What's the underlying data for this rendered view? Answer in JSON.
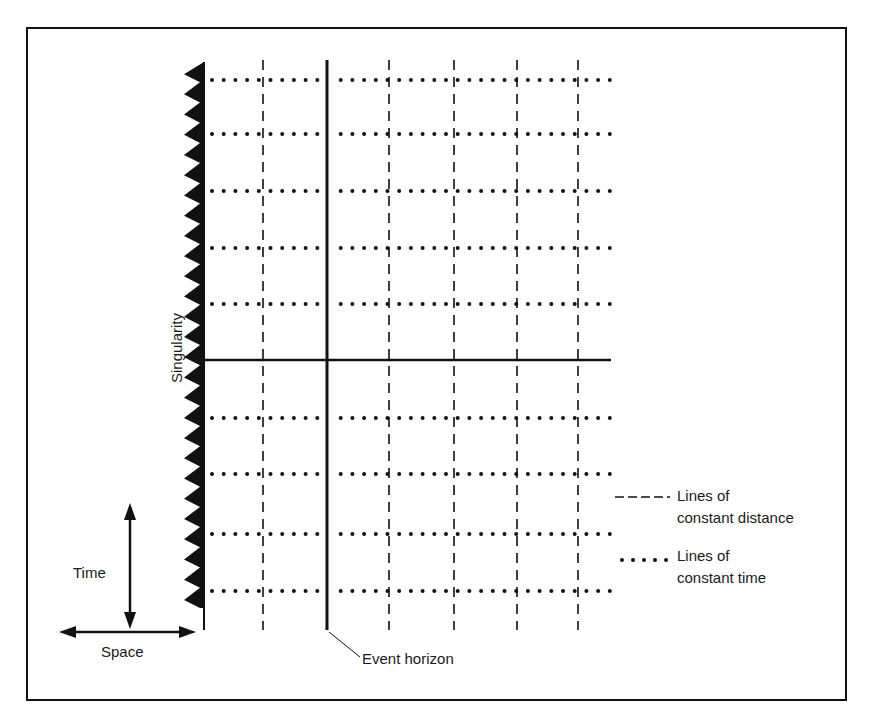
{
  "figure": {
    "border": {
      "x": 27,
      "y": 28,
      "w": 819,
      "h": 672
    },
    "ink_color": "#111111",
    "background": "#ffffff"
  },
  "singularity": {
    "label": "Singularity",
    "line_x": 204,
    "y_top": 62,
    "y_bottom": 630,
    "teeth_y_start": 62,
    "teeth_y_end": 608,
    "teeth_count": 27,
    "teeth_depth": 20
  },
  "event_horizon": {
    "label": "Event horizon",
    "x": 327,
    "y_top": 60,
    "y_bottom": 630
  },
  "horizontal_axis": {
    "y": 360,
    "x_start": 204,
    "x_end": 611
  },
  "distance_lines_x": [
    263,
    389,
    454,
    517,
    578
  ],
  "distance_lines_y": [
    60,
    630
  ],
  "time_lines_y": [
    80,
    134,
    191,
    248,
    304,
    418,
    474,
    534,
    591
  ],
  "time_lines_x": [
    206,
    610
  ],
  "legend": {
    "items": [
      {
        "style": "dashed",
        "line1": "Lines of",
        "line2": "constant distance"
      },
      {
        "style": "dotted",
        "line1": "Lines of",
        "line2": "constant time"
      }
    ]
  },
  "axes_key": {
    "time_label": "Time",
    "space_label": "Space"
  }
}
